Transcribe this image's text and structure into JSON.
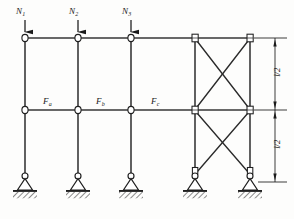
{
  "figure": {
    "type": "structural-frame-diagram",
    "stroke_color": "#1a1a1a",
    "ground_hatch_color": "#2b2b2b"
  },
  "vertical_loads": [
    {
      "name": "load-n1",
      "label": "N",
      "subscript": "1",
      "x": 25,
      "arrow_top_y": 22,
      "arrow_tip_y": 38
    },
    {
      "name": "load-n2",
      "label": "N",
      "subscript": "2",
      "x": 78,
      "arrow_top_y": 22,
      "arrow_tip_y": 38
    },
    {
      "name": "load-n3",
      "label": "N",
      "subscript": "3",
      "x": 131,
      "arrow_top_y": 22,
      "arrow_tip_y": 38
    }
  ],
  "storey_forces": [
    {
      "name": "force-fa",
      "label": "F",
      "subscript": "a",
      "x": 47,
      "y": 100
    },
    {
      "name": "force-fb",
      "label": "F",
      "subscript": "b",
      "x": 100,
      "y": 100
    },
    {
      "name": "force-fc",
      "label": "F",
      "subscript": "c",
      "x": 155,
      "y": 100
    }
  ],
  "dimensions": [
    {
      "name": "dim-upper-storey",
      "label": "l/2",
      "from_y": 38,
      "to_y": 110,
      "x": 275
    },
    {
      "name": "dim-lower-storey",
      "label": "l/2",
      "from_y": 110,
      "to_y": 182,
      "x": 275
    }
  ],
  "geometry": {
    "columns_x": [
      25,
      78,
      131,
      195,
      250
    ],
    "beam_top_y": 38,
    "beam_mid_y": 110,
    "base_y": 182,
    "braced_bay_x": [
      195,
      250
    ],
    "dimension_line_x": 275,
    "extension_line_end_x": 285
  },
  "supports": [
    {
      "name": "support-pin-1",
      "x": 25,
      "type": "pinned"
    },
    {
      "name": "support-pin-2",
      "x": 78,
      "type": "pinned"
    },
    {
      "name": "support-pin-3",
      "x": 131,
      "type": "pinned"
    },
    {
      "name": "support-pin-4",
      "x": 195,
      "type": "pinned"
    },
    {
      "name": "support-pin-5",
      "x": 250,
      "type": "pinned"
    }
  ],
  "braces": [
    {
      "name": "brace-upper-bay-diagonal-a",
      "x1": 195,
      "y1": 38,
      "x2": 250,
      "y2": 110
    },
    {
      "name": "brace-upper-bay-diagonal-b",
      "x1": 250,
      "y1": 38,
      "x2": 195,
      "y2": 110
    },
    {
      "name": "brace-lower-bay-diagonal-a",
      "x1": 195,
      "y1": 110,
      "x2": 250,
      "y2": 182
    },
    {
      "name": "brace-lower-bay-diagonal-b",
      "x1": 250,
      "y1": 110,
      "x2": 195,
      "y2": 182
    }
  ],
  "nodes": [
    {
      "name": "node-top-1",
      "x": 25,
      "y": 38
    },
    {
      "name": "node-top-2",
      "x": 78,
      "y": 38
    },
    {
      "name": "node-top-3",
      "x": 131,
      "y": 38
    },
    {
      "name": "node-top-4",
      "x": 195,
      "y": 38
    },
    {
      "name": "node-top-5",
      "x": 250,
      "y": 38
    },
    {
      "name": "node-mid-1",
      "x": 25,
      "y": 110
    },
    {
      "name": "node-mid-2",
      "x": 78,
      "y": 110
    },
    {
      "name": "node-mid-3",
      "x": 131,
      "y": 110
    },
    {
      "name": "node-mid-4",
      "x": 195,
      "y": 110
    },
    {
      "name": "node-mid-5",
      "x": 250,
      "y": 110
    }
  ]
}
